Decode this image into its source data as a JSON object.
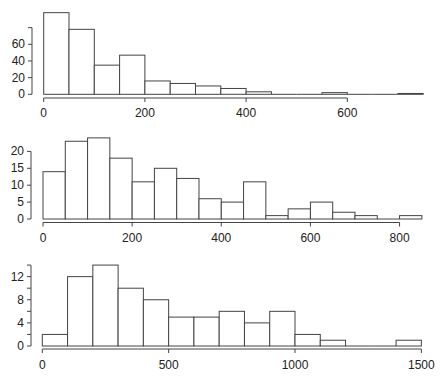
{
  "chart_data": [
    {
      "type": "bar",
      "subtype": "histogram",
      "title": "",
      "xlabel": "",
      "ylabel": "",
      "bin_width": 50,
      "bin_edges_start": 0,
      "values": [
        98,
        78,
        35,
        47,
        16,
        13,
        10,
        7,
        3,
        0,
        0,
        2,
        0,
        0,
        1
      ],
      "xlim": [
        0,
        750
      ],
      "ylim": [
        0,
        80
      ],
      "x_ticks": [
        0,
        200,
        400,
        600
      ],
      "y_ticks": [
        0,
        20,
        40,
        60,
        80
      ],
      "y_tick_labels": [
        "0",
        "20",
        "40",
        "60",
        ""
      ],
      "grid": false,
      "layout": {
        "x0_px": 43.7,
        "px_per_x": 0.506,
        "baseline_px": 94.3,
        "px_per_y": 0.833,
        "yaxis_x_px": 32,
        "xaxis_y_px": 98,
        "xlabel_y_px": 113,
        "xaxis_end": 600
      }
    },
    {
      "type": "bar",
      "subtype": "histogram",
      "title": "",
      "xlabel": "",
      "ylabel": "",
      "bin_width": 50,
      "bin_edges_start": 0,
      "values": [
        14,
        23,
        24,
        18,
        11,
        15,
        12,
        6,
        5,
        11,
        1,
        3,
        5,
        2,
        1,
        0,
        1
      ],
      "xlim": [
        0,
        850
      ],
      "ylim": [
        0,
        20
      ],
      "x_ticks": [
        0,
        200,
        400,
        600,
        800
      ],
      "y_ticks": [
        0,
        5,
        10,
        15,
        20
      ],
      "y_tick_labels": [
        "0",
        "5",
        "10",
        "15",
        "20"
      ],
      "grid": false,
      "layout": {
        "x0_px": 43,
        "px_per_x": 0.4457,
        "baseline_px": 219,
        "px_per_y": 3.38,
        "yaxis_x_px": 31,
        "xaxis_y_px": 222.5,
        "xlabel_y_px": 238,
        "xaxis_end": 800
      }
    },
    {
      "type": "bar",
      "subtype": "histogram",
      "title": "",
      "xlabel": "",
      "ylabel": "",
      "bin_width": 100,
      "bin_edges_start": 0,
      "values": [
        2,
        12,
        14,
        10,
        8,
        5,
        5,
        6,
        4,
        6,
        2,
        1,
        0,
        0,
        1
      ],
      "xlim": [
        0,
        1500
      ],
      "ylim": [
        0,
        14
      ],
      "x_ticks": [
        0,
        500,
        1000,
        1500
      ],
      "y_ticks": [
        0,
        2,
        4,
        6,
        8,
        10,
        12,
        14
      ],
      "y_tick_labels": [
        "0",
        "",
        "4",
        "",
        "8",
        "",
        "12",
        ""
      ],
      "grid": false,
      "layout": {
        "x0_px": 42.3,
        "px_per_x": 0.2527,
        "baseline_px": 346,
        "px_per_y": 5.78,
        "yaxis_x_px": 31,
        "xaxis_y_px": 349,
        "xlabel_y_px": 365,
        "xaxis_end": 1500
      }
    }
  ]
}
